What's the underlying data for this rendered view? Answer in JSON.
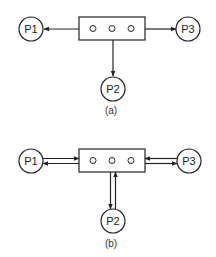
{
  "diagrams": [
    {
      "caption": "(a)",
      "nodes": {
        "left": "P1",
        "bottom": "P2",
        "right": "P3"
      },
      "channel_slots": 3,
      "arrows": "one-way outward from channel to each process"
    },
    {
      "caption": "(b)",
      "nodes": {
        "left": "P1",
        "bottom": "P2",
        "right": "P3"
      },
      "channel_slots": 3,
      "arrows": "two-way between channel and each process"
    }
  ],
  "colors": {
    "stroke": "#222222",
    "background": "#ffffff"
  }
}
